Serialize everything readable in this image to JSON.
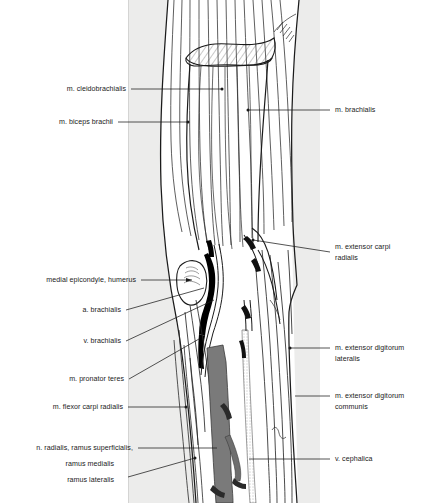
{
  "figure": {
    "panel_background": "#ececeb",
    "page_background": "#ffffff",
    "ink_color": "#1b1b1b",
    "artery_fill": "#000000",
    "nerve_fill": "#7a7a7a"
  },
  "labels_left": [
    {
      "name": "m-cleidobrachialis",
      "text": "m. cleidobrachialis"
    },
    {
      "name": "m-biceps-brachii",
      "text": "m. biceps brachii"
    },
    {
      "name": "medial-epicondyle-humerus",
      "text": "medial epicondyle, humerus"
    },
    {
      "name": "a-brachialis",
      "text": "a. brachialis"
    },
    {
      "name": "v-brachialis",
      "text": "v. brachialis"
    },
    {
      "name": "m-pronator-teres",
      "text": "m. pronator teres"
    },
    {
      "name": "m-flexor-carpi-radialis",
      "text": "m. flexor carpi radialis"
    },
    {
      "name": "n-radialis-ramus-superficialis",
      "text": "n. radialis, ramus  superficialis,"
    },
    {
      "name": "ramus-medialis",
      "text": "ramus medialis"
    },
    {
      "name": "ramus-lateralis",
      "text": "ramus lateralis"
    }
  ],
  "labels_right": [
    {
      "name": "m-brachialis",
      "text": "m. brachialis"
    },
    {
      "name": "m-extensor-carpi-radialis-line1",
      "text": "m. extensor carpi"
    },
    {
      "name": "m-extensor-carpi-radialis-line2",
      "text": "radialis"
    },
    {
      "name": "m-extensor-digitorum-lateralis-line1",
      "text": "m. extensor digitorum"
    },
    {
      "name": "m-extensor-digitorum-lateralis-line2",
      "text": "lateralis"
    },
    {
      "name": "m-extensor-digitorum-communis-line1",
      "text": "m. extensor digitorum"
    },
    {
      "name": "m-extensor-digitorum-communis-line2",
      "text": "communis"
    },
    {
      "name": "v-cephalica",
      "text": "v. cephalica"
    }
  ]
}
